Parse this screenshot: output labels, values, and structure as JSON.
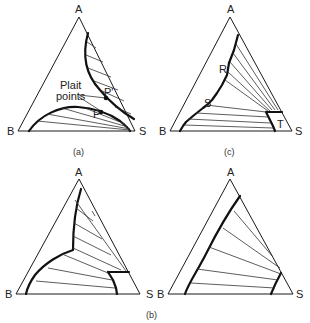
{
  "figure": {
    "panels": [
      {
        "id": "a",
        "caption": "(a)",
        "vertices": {
          "top": "A",
          "left": "B",
          "right": "S"
        },
        "annotations": {
          "plait_label_line1": "Plait",
          "plait_label_line2": "points",
          "p_prime": "P'",
          "p": "P"
        }
      },
      {
        "id": "c",
        "caption": "(c)",
        "vertices": {
          "top": "A",
          "left": "B",
          "right": "S"
        },
        "annotations": {
          "r": "R",
          "s": "S",
          "t": "T"
        }
      },
      {
        "id": "b-left",
        "vertices": {
          "top": "A",
          "left": "B",
          "right": "S"
        }
      },
      {
        "id": "b-right",
        "vertices": {
          "top": "A",
          "left": "B",
          "right": "S"
        }
      }
    ],
    "shared_caption": "(b)"
  }
}
